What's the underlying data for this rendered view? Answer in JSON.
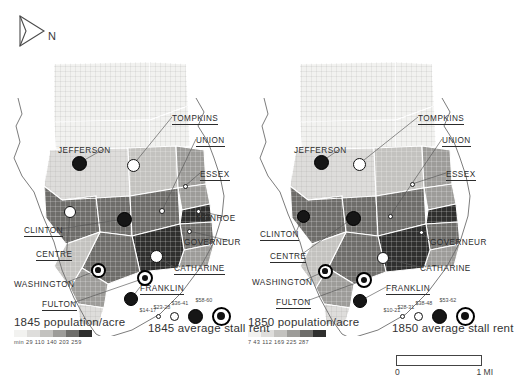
{
  "figure": {
    "north_arrow_label": "N",
    "scale_bar": {
      "min_label": "0",
      "max_label": "1 MI"
    }
  },
  "maps": [
    {
      "id": "map-1845",
      "year": "1845",
      "population_legend": {
        "title": "1845 population/acre",
        "breaks_text": "min 29 110 140 203 259",
        "breaks": [
          "min",
          "29",
          "110",
          "140",
          "203",
          "259"
        ],
        "colors": [
          "#f2f2f0",
          "#dedddb",
          "#c3c2bf",
          "#9d9c99",
          "#6e6d6a",
          "#2f2f2e"
        ]
      },
      "rent_legend": {
        "title": "1845 average stall rent",
        "classes": [
          {
            "label": "$14-17",
            "size": 5,
            "style": "c1"
          },
          {
            "label": "$23-28",
            "size": 9,
            "style": "c2"
          },
          {
            "label": "$36-41",
            "size": 15,
            "style": "c3"
          },
          {
            "label": "$58-60",
            "size": 19,
            "style": "c4"
          }
        ]
      },
      "market_labels": [
        {
          "name": "TOMPKINS",
          "x": 172,
          "y": 68,
          "underline": true
        },
        {
          "name": "UNION",
          "x": 196,
          "y": 90,
          "underline": true
        },
        {
          "name": "ESSEX",
          "x": 200,
          "y": 124,
          "underline": true
        },
        {
          "name": "MONROE",
          "x": 196,
          "y": 168,
          "underline": false
        },
        {
          "name": "GOVERNEUR",
          "x": 184,
          "y": 192,
          "underline": false
        },
        {
          "name": "CATHARINE",
          "x": 174,
          "y": 218,
          "underline": true
        },
        {
          "name": "FRANKLIN",
          "x": 140,
          "y": 238,
          "underline": true
        },
        {
          "name": "JEFFERSON",
          "x": 58,
          "y": 100,
          "underline": false
        },
        {
          "name": "CLINTON",
          "x": 24,
          "y": 180,
          "underline": true
        },
        {
          "name": "CENTRE",
          "x": 36,
          "y": 204,
          "underline": true
        },
        {
          "name": "WASHINGTON",
          "x": 14,
          "y": 234,
          "underline": false
        },
        {
          "name": "FULTON",
          "x": 42,
          "y": 254,
          "underline": true
        }
      ],
      "market_symbols": [
        {
          "name": "JEFFERSON",
          "x": 79,
          "y": 117,
          "size": 15,
          "style": "c3"
        },
        {
          "name": "TOMPKINS",
          "x": 133,
          "y": 119,
          "size": 13,
          "style": "c2"
        },
        {
          "name": "ESSEX",
          "x": 185,
          "y": 140,
          "size": 5,
          "style": "c1"
        },
        {
          "name": "UNION",
          "x": 162,
          "y": 165,
          "size": 6,
          "style": "c1"
        },
        {
          "name": "MONROE",
          "x": 198,
          "y": 165,
          "size": 5,
          "style": "c1"
        },
        {
          "name": "GOVERNEUR",
          "x": 189,
          "y": 185,
          "size": 5,
          "style": "c1"
        },
        {
          "name": "CENTRE",
          "x": 70,
          "y": 166,
          "size": 12,
          "style": "c2"
        },
        {
          "name": "CLINTON",
          "x": 124,
          "y": 173,
          "size": 15,
          "style": "c3"
        },
        {
          "name": "CATHARINE",
          "x": 156,
          "y": 210,
          "size": 13,
          "style": "c2"
        },
        {
          "name": "WASHINGTON",
          "x": 98,
          "y": 224,
          "size": 15,
          "style": "c4"
        },
        {
          "name": "FULTON",
          "x": 145,
          "y": 232,
          "size": 16,
          "style": "c4"
        },
        {
          "name": "FRANKLIN",
          "x": 131,
          "y": 253,
          "size": 14,
          "style": "c3"
        }
      ]
    },
    {
      "id": "map-1850",
      "year": "1850",
      "population_legend": {
        "title": "1850 population/acre",
        "breaks_text": "7 43 112 169 225 287",
        "breaks": [
          "7",
          "43",
          "112",
          "169",
          "225",
          "287"
        ],
        "colors": [
          "#f2f2f0",
          "#dedddb",
          "#c3c2bf",
          "#9d9c99",
          "#6e6d6a",
          "#2f2f2e"
        ]
      },
      "rent_legend": {
        "title": "1850 average stall rent",
        "classes": [
          {
            "label": "$10-21",
            "size": 5,
            "style": "c1"
          },
          {
            "label": "$28-31",
            "size": 9,
            "style": "c2"
          },
          {
            "label": "$38-48",
            "size": 15,
            "style": "c3"
          },
          {
            "label": "$53-62",
            "size": 19,
            "style": "c4"
          }
        ]
      },
      "market_labels": [
        {
          "name": "TOMPKINS",
          "x": 172,
          "y": 68,
          "underline": true
        },
        {
          "name": "UNION",
          "x": 196,
          "y": 90,
          "underline": true
        },
        {
          "name": "ESSEX",
          "x": 200,
          "y": 124,
          "underline": true
        },
        {
          "name": "GOVERNEUR",
          "x": 184,
          "y": 192,
          "underline": false
        },
        {
          "name": "CATHARINE",
          "x": 174,
          "y": 218,
          "underline": false
        },
        {
          "name": "FRANKLIN",
          "x": 140,
          "y": 238,
          "underline": true
        },
        {
          "name": "JEFFERSON",
          "x": 48,
          "y": 100,
          "underline": false
        },
        {
          "name": "CLINTON",
          "x": 14,
          "y": 184,
          "underline": true
        },
        {
          "name": "CENTRE",
          "x": 24,
          "y": 206,
          "underline": true
        },
        {
          "name": "WASHINGTON",
          "x": 6,
          "y": 232,
          "underline": false
        },
        {
          "name": "FULTON",
          "x": 30,
          "y": 252,
          "underline": true
        }
      ],
      "market_symbols": [
        {
          "name": "JEFFERSON",
          "x": 75,
          "y": 116,
          "size": 15,
          "style": "c3"
        },
        {
          "name": "TOMPKINS",
          "x": 113,
          "y": 118,
          "size": 13,
          "style": "c2"
        },
        {
          "name": "ESSEX",
          "x": 166,
          "y": 138,
          "size": 5,
          "style": "c1"
        },
        {
          "name": "UNION",
          "x": 144,
          "y": 170,
          "size": 5,
          "style": "c1"
        },
        {
          "name": "GOVERNEUR",
          "x": 175,
          "y": 186,
          "size": 5,
          "style": "c1"
        },
        {
          "name": "CLINTON",
          "x": 57,
          "y": 170,
          "size": 13,
          "style": "c3"
        },
        {
          "name": "CENTRE",
          "x": 107,
          "y": 172,
          "size": 15,
          "style": "c3"
        },
        {
          "name": "CATHARINE",
          "x": 137,
          "y": 212,
          "size": 12,
          "style": "c2"
        },
        {
          "name": "WASHINGTON",
          "x": 79,
          "y": 225,
          "size": 15,
          "style": "c4"
        },
        {
          "name": "FULTON",
          "x": 118,
          "y": 234,
          "size": 16,
          "style": "c4"
        },
        {
          "name": "FRANKLIN",
          "x": 114,
          "y": 255,
          "size": 14,
          "style": "c3"
        }
      ]
    }
  ]
}
